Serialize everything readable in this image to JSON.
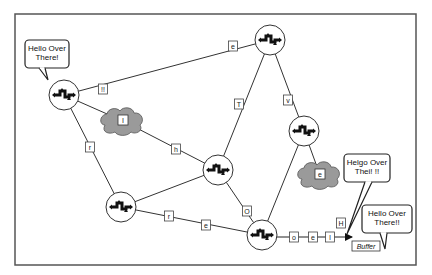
{
  "diagram": {
    "frame": {
      "x": 15,
      "y": 14,
      "w": 401,
      "h": 251
    },
    "colors": {
      "line": "#333333",
      "cloud": "#9a9a9a",
      "node_fill": "#ffffff",
      "icon": "#111111"
    },
    "nodes": [
      {
        "id": "n1",
        "x": 64,
        "y": 95
      },
      {
        "id": "n2",
        "x": 270,
        "y": 40
      },
      {
        "id": "n3",
        "x": 304,
        "y": 131
      },
      {
        "id": "n4",
        "x": 218,
        "y": 170
      },
      {
        "id": "n5",
        "x": 121,
        "y": 207
      },
      {
        "id": "n6",
        "x": 262,
        "y": 235
      }
    ],
    "clouds": [
      {
        "id": "c1",
        "x": 123,
        "y": 121,
        "label": "I"
      },
      {
        "id": "c2",
        "x": 320,
        "y": 175,
        "label": "e"
      }
    ],
    "edges": [
      {
        "from": "n1",
        "to": "n2"
      },
      {
        "from": "n1",
        "to": "c1"
      },
      {
        "from": "c1",
        "to": "n4"
      },
      {
        "from": "n1",
        "to": "n5"
      },
      {
        "from": "n2",
        "to": "n4"
      },
      {
        "from": "n2",
        "to": "n3"
      },
      {
        "from": "n3",
        "to": "n6"
      },
      {
        "from": "n3",
        "to": "c2"
      },
      {
        "from": "n4",
        "to": "n5"
      },
      {
        "from": "n4",
        "to": "n6"
      },
      {
        "from": "n5",
        "to": "n6"
      }
    ],
    "edge_labels": [
      {
        "x": 103,
        "y": 89,
        "text": "!!"
      },
      {
        "x": 233,
        "y": 46,
        "text": "e"
      },
      {
        "x": 90,
        "y": 147,
        "text": "r"
      },
      {
        "x": 176,
        "y": 149,
        "text": "h"
      },
      {
        "x": 239,
        "y": 104,
        "text": "T"
      },
      {
        "x": 288,
        "y": 100,
        "text": "v"
      },
      {
        "x": 247,
        "y": 211,
        "text": "O"
      },
      {
        "x": 169,
        "y": 216,
        "text": "r"
      },
      {
        "x": 206,
        "y": 225,
        "text": "e"
      },
      {
        "x": 294,
        "y": 237,
        "text": "o"
      },
      {
        "x": 313,
        "y": 237,
        "text": "e"
      },
      {
        "x": 330,
        "y": 237,
        "text": "l"
      },
      {
        "x": 341,
        "y": 223,
        "text": "H"
      }
    ],
    "bubbles": [
      {
        "id": "b1",
        "x": 25,
        "y": 40,
        "w": 44,
        "h": 28,
        "lines": [
          "Hello Over",
          "There!"
        ],
        "tail": [
          [
            39,
            68
          ],
          [
            45,
            68
          ],
          [
            48,
            80
          ]
        ]
      },
      {
        "id": "b2",
        "x": 344,
        "y": 154,
        "w": 46,
        "h": 28,
        "lines": [
          "Helgo Over",
          "Thei! !!"
        ],
        "tail": [
          [
            365,
            182
          ],
          [
            372,
            182
          ],
          [
            347,
            234
          ]
        ]
      },
      {
        "id": "b3",
        "x": 362,
        "y": 205,
        "w": 50,
        "h": 28,
        "lines": [
          "Hello Over",
          "There!!"
        ],
        "tail": [
          [
            380,
            233
          ],
          [
            387,
            233
          ],
          [
            385,
            249
          ]
        ]
      }
    ],
    "arrow": {
      "from": [
        262,
        237
      ],
      "to": [
        352,
        237
      ]
    },
    "buffer_label": {
      "x": 352,
      "y": 241,
      "w": 28,
      "h": 10,
      "text": "Buffer"
    }
  }
}
